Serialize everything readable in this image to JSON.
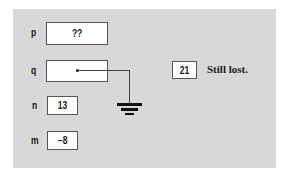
{
  "diagram": {
    "variables": [
      {
        "name": "p",
        "value": "??"
      },
      {
        "name": "q",
        "value": ""
      },
      {
        "name": "n",
        "value": "13"
      },
      {
        "name": "m",
        "value": "−8"
      }
    ],
    "orphan": {
      "value": "21",
      "caption": "Still lost."
    },
    "colors": {
      "panel": "#d8d8d8",
      "box": "#ffffff",
      "border": "#555555"
    }
  }
}
